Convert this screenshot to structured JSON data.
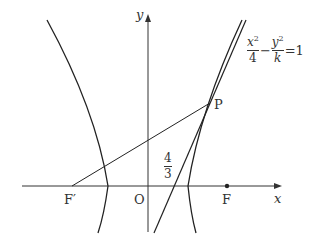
{
  "diagram": {
    "type": "hyperbola-with-tangent",
    "axes": {
      "x_label": "x",
      "y_label": "y",
      "origin_label": "O"
    },
    "points": {
      "focus_right": "F",
      "focus_left": "F′",
      "point_on_curve": "P"
    },
    "equation": {
      "term1_num": "x",
      "term1_num_exp": "2",
      "term1_den": "4",
      "minus": "−",
      "term2_num": "y",
      "term2_num_exp": "2",
      "term2_den": "k",
      "equals": "=1"
    },
    "intercept_label": {
      "num": "4",
      "den": "3"
    },
    "colors": {
      "stroke": "#222222",
      "text": "#333333",
      "background": "#ffffff"
    }
  }
}
